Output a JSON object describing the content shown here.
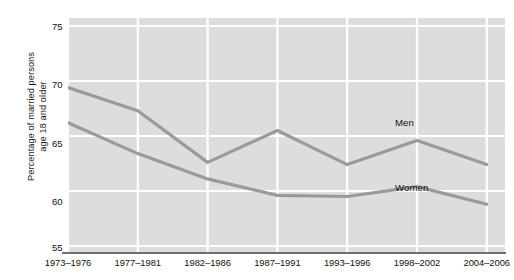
{
  "chart_data": {
    "type": "line",
    "title": "",
    "xlabel": "",
    "ylabel": "Percentage of married persons\nage 18 and older",
    "ylim": [
      55,
      75
    ],
    "yticks": [
      55,
      60,
      65,
      70,
      75
    ],
    "ytick_labels": [
      "55",
      "60",
      "65",
      "70",
      "75"
    ],
    "grid": true,
    "legend_position": "inline-annotation",
    "categories": [
      "1973–1976",
      "1977–1981",
      "1982–1986",
      "1987–1991",
      "1993–1996",
      "1998–2002",
      "2004–2006"
    ],
    "series": [
      {
        "name": "Men",
        "color": "#9a9a9a",
        "values": [
          69.4,
          67.3,
          62.6,
          65.5,
          62.4,
          64.6,
          62.4
        ]
      },
      {
        "name": "Women",
        "color": "#9a9a9a",
        "values": [
          66.2,
          63.4,
          61.1,
          59.6,
          59.5,
          60.4,
          58.8
        ]
      }
    ],
    "annotations": [
      {
        "text": "Men",
        "category": "1998–2002",
        "value": 66.2
      },
      {
        "text": "Women",
        "category": "1998–2002",
        "value": 60.3
      }
    ],
    "colors": {
      "panel_background": "#dddddd",
      "gridline": "#ffffff",
      "axis_line": "#6f6f6f",
      "line": "#9a9a9a",
      "text": "#111111",
      "figure_background": "#ffffff"
    }
  }
}
